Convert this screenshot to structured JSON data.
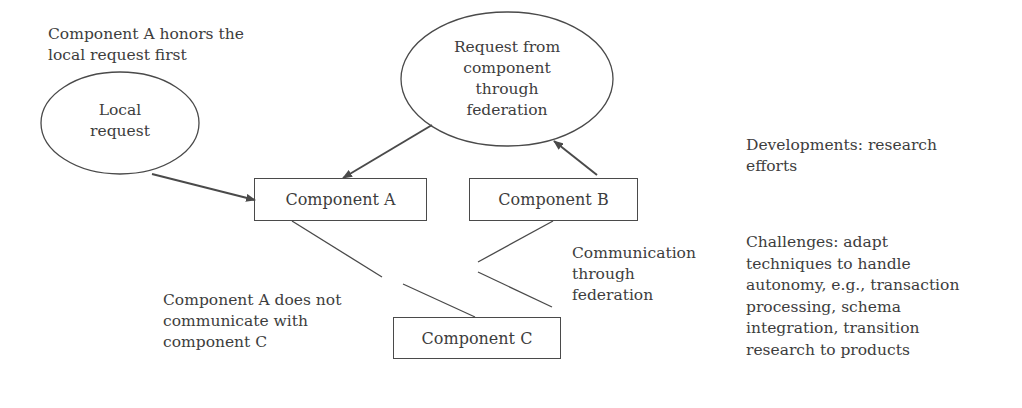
{
  "notes": {
    "honors": [
      "Component A honors the",
      "local request first"
    ],
    "developments": [
      "Developments: research",
      "efforts"
    ],
    "challenges": [
      "Challenges:  adapt",
      "techniques to handle",
      "autonomy, e.g., transaction",
      "processing, schema",
      "integration, transition",
      "research to products"
    ],
    "no_comm": [
      "Component A does not",
      "communicate with",
      "component C"
    ],
    "federation_comm": [
      "Communication",
      "through",
      "federation"
    ]
  },
  "nodes": {
    "local_request": [
      "Local",
      "request"
    ],
    "federation_request": [
      "Request from",
      "component",
      "through",
      "federation"
    ],
    "component_a": "Component A",
    "component_b": "Component B",
    "component_c": "Component C"
  },
  "colors": {
    "stroke": "#4a4a4a",
    "text": "#3d3d3d",
    "background": "#ffffff"
  }
}
